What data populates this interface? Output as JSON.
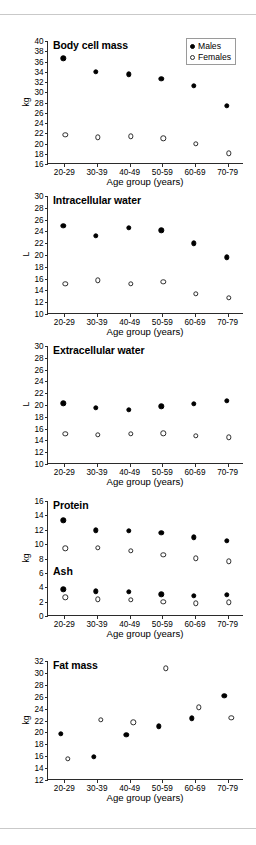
{
  "figure": {
    "legend": {
      "males_label": "Males",
      "females_label": "Females"
    },
    "shared_xlabel": "Age group (years)",
    "categories": [
      "20-29",
      "30-39",
      "40-49",
      "50-59",
      "60-69",
      "70-79"
    ],
    "colors": {
      "male_marker": "#000000",
      "female_marker": "#ffffff",
      "marker_outline": "#2b2b2b",
      "axis": "#2b2b2b",
      "rule": "#c9c9c9",
      "background": "#ffffff"
    }
  },
  "chart_data": [
    {
      "type": "scatter",
      "title": "Body cell mass",
      "xlabel": "Age group (years)",
      "ylabel": "kg",
      "categories": [
        "20-29",
        "30-39",
        "40-49",
        "50-59",
        "60-69",
        "70-79"
      ],
      "ylim": [
        16,
        40
      ],
      "yticks": [
        16,
        18,
        20,
        22,
        24,
        26,
        28,
        30,
        32,
        34,
        36,
        38,
        40
      ],
      "grid": false,
      "legend_position": "top-right",
      "series": [
        {
          "name": "Males",
          "marker": "filled-circle",
          "values": [
            36.6,
            34.0,
            33.5,
            32.6,
            31.3,
            27.3
          ]
        },
        {
          "name": "Females",
          "marker": "open-circle",
          "values": [
            21.7,
            21.2,
            21.4,
            21.0,
            19.9,
            18.1
          ]
        }
      ]
    },
    {
      "type": "scatter",
      "title": "Intracellular water",
      "xlabel": "Age group (years)",
      "ylabel": "L",
      "categories": [
        "20-29",
        "30-39",
        "40-49",
        "50-59",
        "60-69",
        "70-79"
      ],
      "ylim": [
        10,
        30
      ],
      "yticks": [
        10,
        12,
        14,
        16,
        18,
        20,
        22,
        24,
        26,
        28,
        30
      ],
      "grid": false,
      "legend_position": "none",
      "series": [
        {
          "name": "Males",
          "marker": "filled-circle",
          "values": [
            25.0,
            23.3,
            24.6,
            24.2,
            22.0,
            19.6
          ]
        },
        {
          "name": "Females",
          "marker": "open-circle",
          "values": [
            15.1,
            15.7,
            15.1,
            15.5,
            13.4,
            12.7
          ]
        }
      ]
    },
    {
      "type": "scatter",
      "title": "Extracellular water",
      "xlabel": "Age group (years)",
      "ylabel": "L",
      "categories": [
        "20-29",
        "30-39",
        "40-49",
        "50-59",
        "60-69",
        "70-79"
      ],
      "ylim": [
        10,
        30
      ],
      "yticks": [
        10,
        12,
        14,
        16,
        18,
        20,
        22,
        24,
        26,
        28,
        30
      ],
      "grid": false,
      "legend_position": "none",
      "series": [
        {
          "name": "Males",
          "marker": "filled-circle",
          "values": [
            20.3,
            19.5,
            19.2,
            19.8,
            20.2,
            20.7
          ]
        },
        {
          "name": "Females",
          "marker": "open-circle",
          "values": [
            15.1,
            15.0,
            15.1,
            15.2,
            14.8,
            14.5
          ]
        }
      ]
    },
    {
      "type": "scatter",
      "title": "Protein",
      "subtitle": "Ash",
      "xlabel": "Age group (years)",
      "ylabel": "kg",
      "categories": [
        "20-29",
        "30-39",
        "40-49",
        "50-59",
        "60-69",
        "70-79"
      ],
      "ylim": [
        0,
        16
      ],
      "yticks": [
        0,
        2,
        4,
        6,
        8,
        10,
        12,
        14,
        16
      ],
      "grid": false,
      "legend_position": "none",
      "series": [
        {
          "name": "Protein Males",
          "marker": "filled-circle",
          "values": [
            13.3,
            11.9,
            11.85,
            11.55,
            10.95,
            10.5
          ]
        },
        {
          "name": "Protein Females",
          "marker": "open-circle",
          "values": [
            9.4,
            9.5,
            9.05,
            8.55,
            8.05,
            7.6
          ]
        },
        {
          "name": "Ash Males",
          "marker": "filled-circle",
          "values": [
            3.7,
            3.45,
            3.4,
            3.0,
            2.8,
            2.95
          ]
        },
        {
          "name": "Ash Females",
          "marker": "open-circle",
          "values": [
            2.6,
            2.3,
            2.25,
            1.95,
            1.75,
            1.9
          ]
        }
      ]
    },
    {
      "type": "scatter",
      "title": "Fat mass",
      "xlabel": "Age group (years)",
      "ylabel": "kg",
      "categories": [
        "20-29",
        "30-39",
        "40-49",
        "50-59",
        "60-69",
        "70-79"
      ],
      "ylim": [
        12,
        32
      ],
      "yticks": [
        12,
        14,
        16,
        18,
        20,
        22,
        24,
        26,
        28,
        30,
        32
      ],
      "grid": false,
      "legend_position": "none",
      "series": [
        {
          "name": "Males",
          "marker": "filled-circle",
          "values": [
            19.8,
            15.9,
            19.6,
            21.0,
            22.4,
            26.2
          ]
        },
        {
          "name": "Females",
          "marker": "open-circle",
          "values": [
            15.6,
            22.1,
            21.7,
            30.8,
            24.2,
            22.5
          ]
        }
      ]
    }
  ]
}
